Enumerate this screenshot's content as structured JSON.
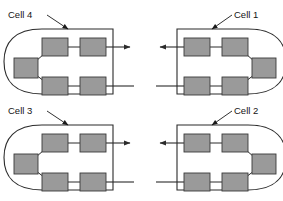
{
  "figure": {
    "type": "diagram",
    "title": "",
    "background_color": "#ffffff",
    "width": 283,
    "height": 201,
    "line_color": "#2b2b2b",
    "box_fill_color": "#9a9a9a",
    "box_stroke_color": "#3a3a3a",
    "label_color": "#141414"
  },
  "cells": [
    {
      "id": "cell-4",
      "label": "Cell 4",
      "orientation": "left",
      "label_position": "top-left",
      "label_x": 8,
      "label_y": 18,
      "leader": {
        "x1": 47,
        "y1": 15,
        "x2": 68,
        "y2": 29
      },
      "origin": {
        "x": 12,
        "y": 27
      },
      "units": [
        {
          "name": "unit-top-left",
          "x": 30,
          "y": 11,
          "w": 26,
          "h": 18
        },
        {
          "name": "unit-top-right",
          "x": 68,
          "y": 11,
          "w": 26,
          "h": 18
        },
        {
          "name": "unit-side",
          "x": 2,
          "y": 31,
          "w": 24,
          "h": 20
        },
        {
          "name": "unit-bottom-left",
          "x": 30,
          "y": 50,
          "w": 26,
          "h": 18
        },
        {
          "name": "unit-bottom-right",
          "x": 68,
          "y": 50,
          "w": 26,
          "h": 18
        }
      ],
      "output_arrow": {
        "label": "output",
        "direction": "right"
      },
      "input_line": {
        "label": "input",
        "direction": "right"
      }
    },
    {
      "id": "cell-1",
      "label": "Cell 1",
      "orientation": "right",
      "label_position": "top-right",
      "label_x": 234,
      "label_y": 18,
      "leader": {
        "x1": 232,
        "y1": 15,
        "x2": 212,
        "y2": 29
      },
      "origin": {
        "x": 154,
        "y": 27
      },
      "units": [
        {
          "name": "unit-top-left",
          "x": 30,
          "y": 11,
          "w": 26,
          "h": 18
        },
        {
          "name": "unit-top-right",
          "x": 68,
          "y": 11,
          "w": 26,
          "h": 18
        },
        {
          "name": "unit-side",
          "x": 98,
          "y": 31,
          "w": 24,
          "h": 20
        },
        {
          "name": "unit-bottom-left",
          "x": 30,
          "y": 50,
          "w": 26,
          "h": 18
        },
        {
          "name": "unit-bottom-right",
          "x": 68,
          "y": 50,
          "w": 26,
          "h": 18
        }
      ],
      "output_arrow": {
        "label": "output",
        "direction": "left"
      },
      "input_line": {
        "label": "input",
        "direction": "left"
      }
    },
    {
      "id": "cell-3",
      "label": "Cell 3",
      "orientation": "left",
      "label_position": "top-left",
      "label_x": 8,
      "label_y": 114,
      "leader": {
        "x1": 47,
        "y1": 111,
        "x2": 68,
        "y2": 125
      },
      "origin": {
        "x": 12,
        "y": 123
      },
      "units": [
        {
          "name": "unit-top-left",
          "x": 30,
          "y": 11,
          "w": 26,
          "h": 18
        },
        {
          "name": "unit-top-right",
          "x": 68,
          "y": 11,
          "w": 26,
          "h": 18
        },
        {
          "name": "unit-side",
          "x": 2,
          "y": 31,
          "w": 24,
          "h": 20
        },
        {
          "name": "unit-bottom-left",
          "x": 30,
          "y": 50,
          "w": 26,
          "h": 18
        },
        {
          "name": "unit-bottom-right",
          "x": 68,
          "y": 50,
          "w": 26,
          "h": 18
        }
      ],
      "output_arrow": {
        "label": "output",
        "direction": "right"
      },
      "input_line": {
        "label": "input",
        "direction": "right"
      }
    },
    {
      "id": "cell-2",
      "label": "Cell 2",
      "orientation": "right",
      "label_position": "top-right",
      "label_x": 234,
      "label_y": 114,
      "leader": {
        "x1": 232,
        "y1": 111,
        "x2": 212,
        "y2": 125
      },
      "origin": {
        "x": 154,
        "y": 123
      },
      "units": [
        {
          "name": "unit-top-left",
          "x": 30,
          "y": 11,
          "w": 26,
          "h": 18
        },
        {
          "name": "unit-top-right",
          "x": 68,
          "y": 11,
          "w": 26,
          "h": 18
        },
        {
          "name": "unit-side",
          "x": 98,
          "y": 31,
          "w": 24,
          "h": 20
        },
        {
          "name": "unit-bottom-left",
          "x": 30,
          "y": 50,
          "w": 26,
          "h": 18
        },
        {
          "name": "unit-bottom-right",
          "x": 68,
          "y": 50,
          "w": 26,
          "h": 18
        }
      ],
      "output_arrow": {
        "label": "output",
        "direction": "left"
      },
      "input_line": {
        "label": "input",
        "direction": "left"
      }
    }
  ]
}
